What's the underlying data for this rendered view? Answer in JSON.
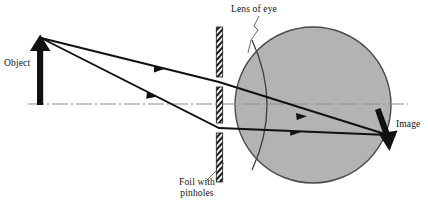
{
  "diagram": {
    "type": "optics-ray-diagram",
    "width": 428,
    "height": 206,
    "background_color": "#ffffff",
    "ink_color": "#111111",
    "eye_fill_color": "#b3b3b3",
    "eye_stroke_color": "#4a4a4a",
    "axis_color": "#8c8c8c",
    "labels": {
      "object": "Object",
      "lens_of_eye": "Lens of eye",
      "foil_with_pinholes_line1": "Foil with",
      "foil_with_pinholes_line2": "pinholes",
      "image": "Image"
    },
    "elements": {
      "object_arrow": {
        "name": "object-arrow",
        "x": 40,
        "tip_y": 36,
        "base_y": 105,
        "direction": "up",
        "shaft_width": 6
      },
      "optical_axis": {
        "name": "optical-axis",
        "y": 104,
        "x_start": 28,
        "x_end": 408,
        "style": "dash-dot"
      },
      "foil": {
        "name": "pinhole-foil",
        "x": 219,
        "top_y": 27,
        "bottom_y": 182,
        "strip_width": 6,
        "hatched": true,
        "pinholes": [
          {
            "name": "pinhole-upper",
            "y": 82,
            "gap": 10
          },
          {
            "name": "pinhole-lower",
            "y": 128,
            "gap": 10
          }
        ]
      },
      "eyeball": {
        "name": "eyeball-circle",
        "cx": 313,
        "cy": 105,
        "r": 78
      },
      "lens_arc": {
        "name": "eye-lens-arc",
        "top_x": 252,
        "top_y": 40,
        "bottom_x": 252,
        "bottom_y": 170,
        "bulge": "right"
      },
      "rays": [
        {
          "name": "ray-upper",
          "from_x": 40,
          "from_y": 38,
          "pinhole_x": 219,
          "pinhole_y": 82,
          "to_x": 388,
          "to_y": 135,
          "arrow_at": 0.52
        },
        {
          "name": "ray-lower",
          "from_x": 40,
          "from_y": 38,
          "pinhole_x": 219,
          "pinhole_y": 128,
          "to_x": 388,
          "to_y": 135,
          "arrow_at": 0.55
        }
      ],
      "image_arrow": {
        "name": "image-arrow",
        "x_top": 377,
        "y_top": 110,
        "x_tip": 389,
        "y_tip": 148,
        "direction": "down-inverted",
        "shaft_width": 5
      },
      "leader_lines": [
        {
          "name": "leader-lens-of-eye",
          "from_x": 258,
          "from_y": 16,
          "to_x": 248,
          "to_y": 52
        },
        {
          "name": "leader-foil",
          "from_x": 222,
          "from_y": 166,
          "to_x": 205,
          "to_y": 182
        }
      ]
    }
  }
}
